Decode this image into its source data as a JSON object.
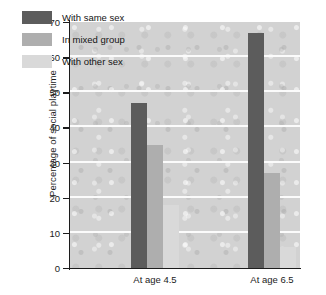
{
  "chart_data": {
    "type": "bar",
    "title": "",
    "xlabel": "",
    "ylabel": "Percentage of social playtime",
    "categories": [
      "At age 4.5",
      "At age 6.5"
    ],
    "series": [
      {
        "name": "With same sex",
        "color": "#5c5c5c",
        "values": [
          47,
          67
        ]
      },
      {
        "name": "In mixed group",
        "color": "#aeaeae",
        "values": [
          35,
          27
        ]
      },
      {
        "name": "With other sex",
        "color": "#d9d9d9",
        "values": [
          18,
          6
        ]
      }
    ],
    "ylim": [
      0,
      70
    ],
    "yticks": [
      0,
      10,
      20,
      30,
      40,
      50,
      60,
      70
    ],
    "ytick_labels": [
      "0",
      "10",
      "20",
      "30",
      "40",
      "50",
      "60",
      "70"
    ],
    "grid": true,
    "grid_color": "#fbfbfb",
    "plot_background": "#d2d2d2",
    "axis_color": "#1c1c1c",
    "legend_position": "top-left"
  }
}
